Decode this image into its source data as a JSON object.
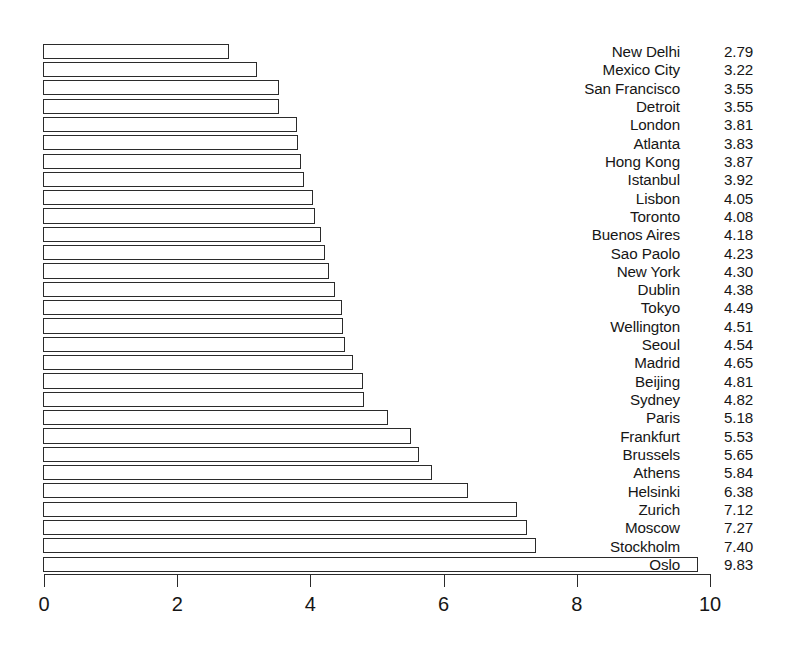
{
  "chart_data": {
    "type": "bar",
    "orientation": "horizontal",
    "title": "",
    "subtitle": "",
    "xlabel": "",
    "ylabel": "",
    "xlim": [
      0,
      10
    ],
    "ylim": null,
    "grid": false,
    "legend": null,
    "legend_position": "none",
    "xticks": [
      0,
      2,
      4,
      6,
      8,
      10
    ],
    "xtick_labels": [
      "0",
      "2",
      "4",
      "6",
      "8",
      "10"
    ],
    "value_labels_shown": true,
    "categories": [
      "New Delhi",
      "Mexico City",
      "San Francisco",
      "Detroit",
      "London",
      "Atlanta",
      "Hong Kong",
      "Istanbul",
      "Lisbon",
      "Toronto",
      "Buenos Aires",
      "Sao Paolo",
      "New York",
      "Dublin",
      "Tokyo",
      "Wellington",
      "Seoul",
      "Madrid",
      "Beijing",
      "Sydney",
      "Paris",
      "Frankfurt",
      "Brussels",
      "Athens",
      "Helsinki",
      "Zurich",
      "Moscow",
      "Stockholm",
      "Oslo"
    ],
    "values": [
      2.79,
      3.22,
      3.55,
      3.55,
      3.81,
      3.83,
      3.87,
      3.92,
      4.05,
      4.08,
      4.18,
      4.23,
      4.3,
      4.38,
      4.49,
      4.51,
      4.54,
      4.65,
      4.81,
      4.82,
      5.18,
      5.53,
      5.65,
      5.84,
      6.38,
      7.12,
      7.27,
      7.4,
      9.83
    ],
    "value_text": [
      "2.79",
      "3.22",
      "3.55",
      "3.55",
      "3.81",
      "3.83",
      "3.87",
      "3.92",
      "4.05",
      "4.08",
      "4.18",
      "4.23",
      "4.30",
      "4.38",
      "4.49",
      "4.51",
      "4.54",
      "4.65",
      "4.81",
      "4.82",
      "5.18",
      "5.53",
      "5.65",
      "5.84",
      "6.38",
      "7.12",
      "7.27",
      "7.40",
      "9.83"
    ],
    "colors": {
      "bar_fill": "#ffffff",
      "bar_stroke": "#2b2b2b",
      "axis": "#2b2b2b",
      "text": "#161616",
      "background": "#ffffff"
    }
  }
}
